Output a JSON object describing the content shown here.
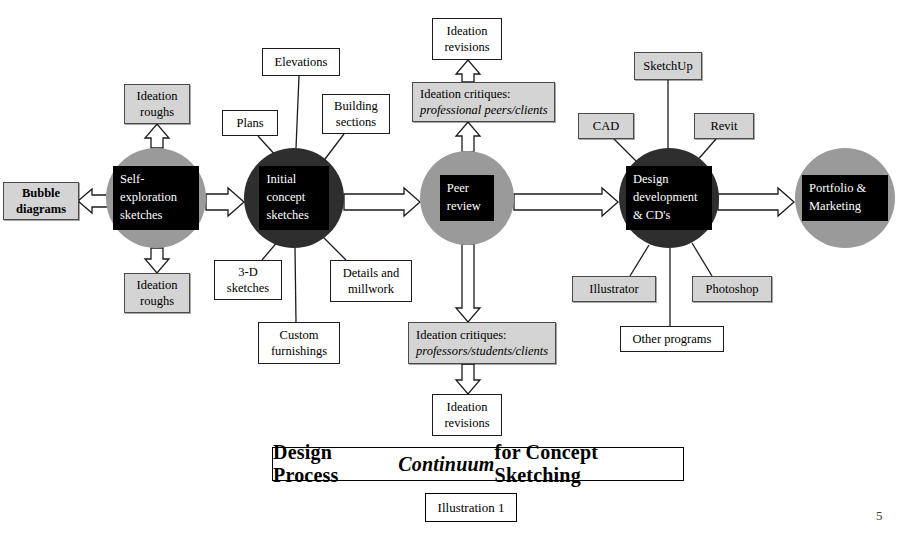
{
  "document": {
    "page_number": "5",
    "title_part1": "Design Process ",
    "title_italic": "Continuum",
    "title_part2": " for Concept Sketching",
    "caption": "Illustration 1"
  },
  "colors": {
    "node_light": "#9a9a9a",
    "node_dark": "#2e2e2e",
    "node_inner": "#000000",
    "node_text": "#ffffff",
    "box_gray": "#d4d4d4",
    "box_white": "#ffffff",
    "stroke": "#1c1c1c"
  },
  "nodes": [
    {
      "id": "self-exploration-sketches",
      "label": "Self-\nexploration\nsketches",
      "shade": "light",
      "cx": 156,
      "cy": 198,
      "r": 50
    },
    {
      "id": "initial-concept-sketches",
      "label": "Initial\nconcept\nsketches",
      "shade": "dark",
      "cx": 294,
      "cy": 198,
      "r": 50
    },
    {
      "id": "peer-review",
      "label": "Peer\nreview",
      "shade": "light",
      "cx": 467,
      "cy": 198,
      "r": 47
    },
    {
      "id": "design-development",
      "label": "Design\ndevelopment\n& CD's",
      "shade": "dark",
      "cx": 669,
      "cy": 198,
      "r": 50
    },
    {
      "id": "portfolio-marketing",
      "label": "Portfolio &\nMarketing",
      "shade": "light",
      "cx": 845,
      "cy": 198,
      "r": 50
    }
  ],
  "boxes": [
    {
      "id": "bubble-diagrams",
      "lines": [
        "Bubble",
        "diagrams"
      ],
      "fill": "gray",
      "bold": true,
      "x": 3,
      "y": 182,
      "w": 76,
      "h": 38
    },
    {
      "id": "ideation-roughs-top-left",
      "lines": [
        "Ideation",
        "roughs"
      ],
      "fill": "gray",
      "bold": false,
      "x": 124,
      "y": 84,
      "w": 66,
      "h": 40
    },
    {
      "id": "ideation-roughs-bottom-left",
      "lines": [
        "Ideation",
        "roughs"
      ],
      "fill": "gray",
      "bold": false,
      "x": 124,
      "y": 273,
      "w": 66,
      "h": 40
    },
    {
      "id": "plans",
      "lines": [
        "Plans"
      ],
      "fill": "white",
      "bold": false,
      "x": 222,
      "y": 110,
      "w": 56,
      "h": 26
    },
    {
      "id": "elevations",
      "lines": [
        "Elevations"
      ],
      "fill": "white",
      "bold": false,
      "x": 262,
      "y": 48,
      "w": 78,
      "h": 28
    },
    {
      "id": "building-sections",
      "lines": [
        "Building",
        "sections"
      ],
      "fill": "white",
      "bold": false,
      "x": 322,
      "y": 94,
      "w": 68,
      "h": 40
    },
    {
      "id": "3d-sketches",
      "lines": [
        "3-D",
        "sketches"
      ],
      "fill": "white",
      "bold": false,
      "x": 214,
      "y": 260,
      "w": 68,
      "h": 40
    },
    {
      "id": "details-and-millwork",
      "lines": [
        "Details and",
        "millwork"
      ],
      "fill": "white",
      "bold": false,
      "x": 330,
      "y": 260,
      "w": 82,
      "h": 42
    },
    {
      "id": "custom-furnishings",
      "lines": [
        "Custom",
        "furnishings"
      ],
      "fill": "white",
      "bold": false,
      "x": 258,
      "y": 322,
      "w": 82,
      "h": 42
    },
    {
      "id": "ideation-revisions-top",
      "lines": [
        "Ideation",
        "revisions"
      ],
      "fill": "white",
      "bold": false,
      "x": 432,
      "y": 18,
      "w": 70,
      "h": 42
    },
    {
      "id": "ideation-revisions-bottom",
      "lines": [
        "Ideation",
        "revisions"
      ],
      "fill": "white",
      "bold": false,
      "x": 432,
      "y": 394,
      "w": 70,
      "h": 42
    },
    {
      "id": "sketchup",
      "lines": [
        "SketchUp"
      ],
      "fill": "gray",
      "bold": false,
      "x": 634,
      "y": 52,
      "w": 68,
      "h": 28
    },
    {
      "id": "cad",
      "lines": [
        "CAD"
      ],
      "fill": "gray",
      "bold": false,
      "x": 578,
      "y": 113,
      "w": 56,
      "h": 26
    },
    {
      "id": "revit",
      "lines": [
        "Revit"
      ],
      "fill": "gray",
      "bold": false,
      "x": 694,
      "y": 113,
      "w": 60,
      "h": 26
    },
    {
      "id": "illustrator",
      "lines": [
        "Illustrator"
      ],
      "fill": "gray",
      "bold": false,
      "x": 572,
      "y": 276,
      "w": 84,
      "h": 26
    },
    {
      "id": "photoshop",
      "lines": [
        "Photoshop"
      ],
      "fill": "gray",
      "bold": false,
      "x": 692,
      "y": 276,
      "w": 80,
      "h": 26
    },
    {
      "id": "other-programs",
      "lines": [
        "Other programs"
      ],
      "fill": "white",
      "bold": false,
      "x": 620,
      "y": 326,
      "w": 104,
      "h": 26
    }
  ],
  "critique_boxes": [
    {
      "id": "ideation-critiques-professional",
      "line1": "Ideation critiques:",
      "line2": "professional peers/clients",
      "fill": "gray",
      "x": 412,
      "y": 82,
      "w": 143,
      "h": 40
    },
    {
      "id": "ideation-critiques-professors",
      "line1": "Ideation critiques:",
      "line2": "professors/students/clients",
      "fill": "gray",
      "x": 408,
      "y": 322,
      "w": 148,
      "h": 42
    }
  ],
  "connectors": {
    "block_arrows": [
      {
        "id": "self-exploration-to-bubble-diagrams",
        "from": "self-exploration-sketches",
        "to": "bubble-diagrams",
        "direction": "left"
      },
      {
        "id": "self-exploration-to-ideation-roughs-top",
        "from": "self-exploration-sketches",
        "to": "ideation-roughs-top-left",
        "direction": "up"
      },
      {
        "id": "self-exploration-to-ideation-roughs-bottom",
        "from": "self-exploration-sketches",
        "to": "ideation-roughs-bottom-left",
        "direction": "down"
      },
      {
        "id": "self-exploration-to-initial-concept",
        "from": "self-exploration-sketches",
        "to": "initial-concept-sketches",
        "direction": "right"
      },
      {
        "id": "initial-concept-to-peer-review",
        "from": "initial-concept-sketches",
        "to": "peer-review",
        "direction": "right"
      },
      {
        "id": "peer-review-to-critiques-professional",
        "from": "peer-review",
        "to": "ideation-critiques-professional",
        "direction": "up"
      },
      {
        "id": "critiques-professional-to-revisions",
        "from": "ideation-critiques-professional",
        "to": "ideation-revisions-top",
        "direction": "up"
      },
      {
        "id": "peer-review-to-critiques-professors",
        "from": "peer-review",
        "to": "ideation-critiques-professors",
        "direction": "down"
      },
      {
        "id": "critiques-professors-to-revisions",
        "from": "ideation-critiques-professors",
        "to": "ideation-revisions-bottom",
        "direction": "down"
      },
      {
        "id": "peer-review-to-design-development",
        "from": "peer-review",
        "to": "design-development",
        "direction": "right"
      },
      {
        "id": "design-development-to-portfolio",
        "from": "design-development",
        "to": "portfolio-marketing",
        "direction": "right"
      }
    ],
    "plain_lines": [
      {
        "id": "plans-to-initial-concept",
        "from": "plans",
        "to": "initial-concept-sketches"
      },
      {
        "id": "elevations-to-initial-concept",
        "from": "elevations",
        "to": "initial-concept-sketches"
      },
      {
        "id": "building-sections-to-initial-concept",
        "from": "building-sections",
        "to": "initial-concept-sketches"
      },
      {
        "id": "3d-sketches-to-initial-concept",
        "from": "3d-sketches",
        "to": "initial-concept-sketches"
      },
      {
        "id": "details-millwork-to-initial-concept",
        "from": "details-and-millwork",
        "to": "initial-concept-sketches"
      },
      {
        "id": "custom-furnishings-to-initial-concept",
        "from": "custom-furnishings",
        "to": "initial-concept-sketches"
      },
      {
        "id": "sketchup-to-design-development",
        "from": "sketchup",
        "to": "design-development"
      },
      {
        "id": "cad-to-design-development",
        "from": "cad",
        "to": "design-development"
      },
      {
        "id": "revit-to-design-development",
        "from": "revit",
        "to": "design-development"
      },
      {
        "id": "illustrator-to-design-development",
        "from": "illustrator",
        "to": "design-development"
      },
      {
        "id": "photoshop-to-design-development",
        "from": "photoshop",
        "to": "design-development"
      },
      {
        "id": "other-programs-to-design-development",
        "from": "other-programs",
        "to": "design-development"
      }
    ]
  }
}
